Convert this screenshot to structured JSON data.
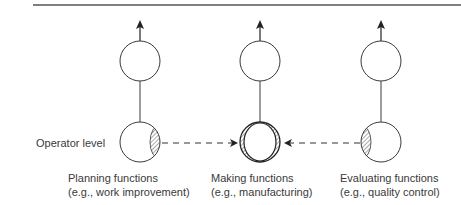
{
  "diagram": {
    "type": "functional-hierarchy",
    "level_label": "Operator level",
    "columns": [
      {
        "id": "planning",
        "title": "Planning functions",
        "example": "(e.g., work improvement)",
        "x": 140
      },
      {
        "id": "making",
        "title": "Making functions",
        "example": "(e.g., manufacturing)",
        "x": 260
      },
      {
        "id": "evaluating",
        "title": "Evaluating functions",
        "example": "(e.g., quality control)",
        "x": 381
      }
    ],
    "edges": [
      {
        "from": "planning",
        "to": "making",
        "style": "dashed-arrow"
      },
      {
        "from": "evaluating",
        "to": "making",
        "style": "dashed-arrow"
      }
    ],
    "colors": {
      "stroke": "#3a3a3a",
      "rule": "#555555",
      "hatch": "#444444"
    }
  }
}
